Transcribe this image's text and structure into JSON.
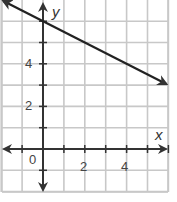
{
  "chart_data": {
    "type": "line",
    "title": "",
    "xlabel": "x",
    "ylabel": "y",
    "xlim": [
      -2,
      6
    ],
    "ylim": [
      -2,
      7
    ],
    "grid": true,
    "x_tick_labels": [
      "0",
      "2",
      "4"
    ],
    "y_tick_labels": [
      "2",
      "4"
    ],
    "series": [
      {
        "name": "line",
        "equation": "y = -0.5x + 6",
        "points": [
          [
            -1.9,
            6.95
          ],
          [
            0,
            6
          ],
          [
            2,
            5
          ],
          [
            4,
            4
          ],
          [
            5.9,
            3.05
          ]
        ],
        "arrows_both_ends": true
      }
    ],
    "colors": {
      "grid": "#c8c8c8",
      "axis": "#333333",
      "line": "#222222"
    }
  },
  "labels": {
    "x_axis": "x",
    "y_axis": "y",
    "origin": "0",
    "x2": "2",
    "x4": "4",
    "y2": "2",
    "y4": "4"
  }
}
